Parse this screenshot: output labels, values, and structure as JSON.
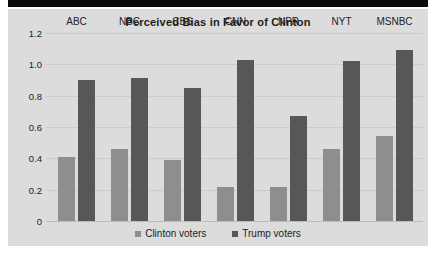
{
  "page": {
    "background_color": "#ffffff",
    "panel_color": "#dcdcdc",
    "scan_band_color": "#0b0b0b"
  },
  "chart_data": {
    "type": "bar",
    "title": "Perceived Bias in Favor of Clinton",
    "xlabel": "",
    "ylabel": "",
    "categories": [
      "ABC",
      "NBC",
      "CBS",
      "CNN",
      "NPR",
      "NYT",
      "MSNBC"
    ],
    "series": [
      {
        "name": "Clinton voters",
        "color": "#8e8e8e",
        "values": [
          0.41,
          0.46,
          0.39,
          0.22,
          0.22,
          0.46,
          0.54
        ]
      },
      {
        "name": "Trump voters",
        "color": "#575757",
        "values": [
          0.9,
          0.91,
          0.85,
          1.03,
          0.67,
          1.02,
          1.09
        ]
      }
    ],
    "ylim": [
      0,
      1.2
    ],
    "yticks": [
      0,
      0.2,
      0.4,
      0.6,
      0.8,
      1.0,
      1.2
    ],
    "ytick_labels": [
      "0",
      "0.2",
      "0.4",
      "0.6",
      "0.8",
      "1.0",
      "1.2"
    ],
    "grid": true,
    "legend_position": "bottom",
    "category_label_position": "top"
  }
}
